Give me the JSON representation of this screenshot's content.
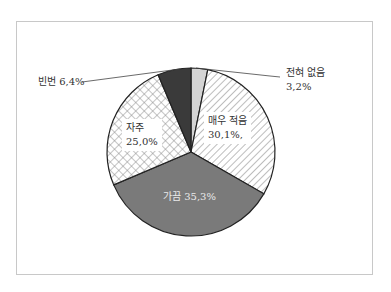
{
  "chart_data": {
    "type": "pie",
    "title": "",
    "start_angle": "12 o'clock",
    "direction": "clockwise",
    "categories": [
      "전혀 없음",
      "매우 적음",
      "가끔",
      "자주",
      "빈번"
    ],
    "values": [
      3.2,
      30.1,
      35.3,
      25.0,
      6.4
    ],
    "unit": "%",
    "slices": [
      {
        "label": "전혀 없음",
        "value": 3.2,
        "display": "3,2%",
        "fill": "#d4d4d4",
        "pattern": "solid-light"
      },
      {
        "label": "매우 적음",
        "value": 30.1,
        "display": "30,1%,",
        "fill": "#ffffff",
        "pattern": "diagonal-hatch"
      },
      {
        "label": "가끔",
        "value": 35.3,
        "display": "35,3%",
        "fill": "#7a7a7a",
        "pattern": "solid-mid"
      },
      {
        "label": "자주",
        "value": 25.0,
        "display": "25,0%",
        "fill": "#ffffff",
        "pattern": "crosshatch"
      },
      {
        "label": "빈번",
        "value": 6.4,
        "display": "6,4%",
        "fill": "#3a3a3a",
        "pattern": "solid-dark"
      }
    ],
    "legend": "none (direct labels)"
  },
  "labels": {
    "never": {
      "name": "전혀 없음",
      "pct": "3,2%"
    },
    "very_little": {
      "name": "매우 적음",
      "pct": "30,1%,"
    },
    "sometimes": {
      "text": "가끔  35,3%"
    },
    "often": {
      "name": "자주",
      "pct": "25,0%"
    },
    "frequent": {
      "text": "빈번  6,4%"
    }
  }
}
